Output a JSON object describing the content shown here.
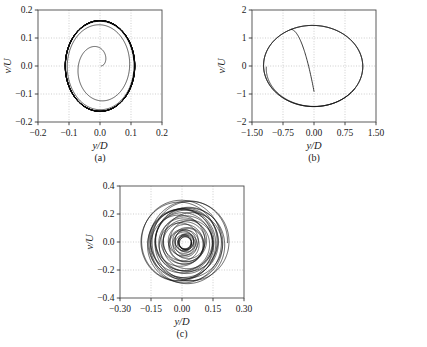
{
  "figure": {
    "background": "#ffffff",
    "curve_color": "#0a0a0a",
    "grid_color": "#b9b9b9",
    "frame_color": "#4a4a4a"
  },
  "chart_data": [
    {
      "type": "line",
      "name": "panel-a",
      "panel_label": "(a)",
      "title": "",
      "xlabel": "y/D",
      "ylabel": "v/U",
      "xlim": [
        -0.2,
        0.2
      ],
      "ylim": [
        -0.2,
        0.2
      ],
      "xticks": [
        -0.2,
        -0.1,
        0.0,
        0.1,
        0.2
      ],
      "xticklabels": [
        "−0.2",
        "−0.1",
        "0.0",
        "0.1",
        "0.2"
      ],
      "yticks": [
        -0.2,
        -0.1,
        0.0,
        0.1,
        0.2
      ],
      "yticklabels": [
        "−0.2",
        "−0.1",
        "0.0",
        "0.1",
        "0.2"
      ],
      "grid": true,
      "description": "Outward spiral from origin converging onto an elliptical limit cycle",
      "trajectory": {
        "kind": "growing_spiral",
        "center": [
          0.0,
          0.0
        ],
        "r0_x": 0.004,
        "r0_y": 0.006,
        "rmax_x": 0.112,
        "rmax_y": 0.162,
        "turns": 13.5,
        "growth": 0.3,
        "phase": 0.0,
        "limit_cycle_turns": 3.2,
        "line_width": 0.65
      }
    },
    {
      "type": "line",
      "name": "panel-b",
      "panel_label": "(b)",
      "title": "",
      "xlabel": "y/D",
      "ylabel": "v/U",
      "xlim": [
        -1.5,
        1.5
      ],
      "ylim": [
        -2,
        2
      ],
      "xticks": [
        -1.5,
        -0.75,
        0.0,
        0.75,
        1.5
      ],
      "xticklabels": [
        "−1.50",
        "−0.75",
        "0.00",
        "0.75",
        "1.50"
      ],
      "yticks": [
        -2,
        -1,
        0,
        1,
        2
      ],
      "yticklabels": [
        "−2",
        "−1",
        "0",
        "1",
        "2"
      ],
      "grid": true,
      "description": "Single large elliptical limit cycle with a short inner transient loop",
      "trajectory": {
        "kind": "ellipse_with_transient",
        "center": [
          -0.02,
          0.0
        ],
        "rmax_x": 1.2,
        "rmax_y": 1.45,
        "tilt_deg": 2.0,
        "turns": 2.4,
        "growth": 0.055,
        "phase": 3.14159,
        "transient_end": [
          0.0,
          -1.15
        ],
        "line_width": 0.8
      }
    },
    {
      "type": "line",
      "name": "panel-c",
      "panel_label": "(c)",
      "title": "",
      "xlabel": "y/D",
      "ylabel": "v/U",
      "xlim": [
        -0.3,
        0.3
      ],
      "ylim": [
        -0.4,
        0.4
      ],
      "xticks": [
        -0.3,
        -0.15,
        0.0,
        0.15,
        0.3
      ],
      "xticklabels": [
        "−0.30",
        "−0.15",
        "0.00",
        "0.15",
        "0.30"
      ],
      "yticks": [
        -0.4,
        -0.2,
        0.0,
        0.2,
        0.4
      ],
      "yticklabels": [
        "−0.4",
        "−0.2",
        "0.0",
        "0.2",
        "0.4"
      ],
      "grid": true,
      "description": "Quasi-periodic attractor: many overlapping loops of differing amplitude, modulated beating",
      "trajectory": {
        "kind": "quasiperiodic",
        "center": [
          0.015,
          -0.005
        ],
        "rmax_x": 0.195,
        "rmax_y": 0.305,
        "rmin_frac": 0.16,
        "turns": 34,
        "modulation_cycles": 4.6,
        "drift_x": 0.028,
        "drift_phase": 1.1,
        "line_width": 0.62
      }
    }
  ]
}
